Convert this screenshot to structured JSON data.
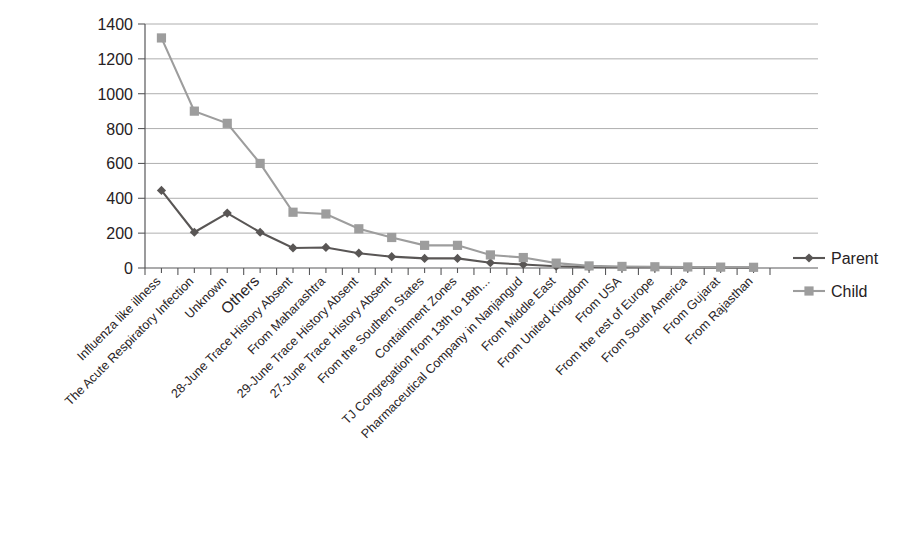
{
  "chart_data": {
    "type": "line",
    "title": "",
    "xlabel": "",
    "ylabel": "",
    "ylim": [
      0,
      1400
    ],
    "ytick_step": 200,
    "yticks": [
      "0",
      "200",
      "400",
      "600",
      "800",
      "1000",
      "1200",
      "1400"
    ],
    "grid": true,
    "legend_position": "right",
    "categories": [
      "Influenza like illness",
      "The Acute Respiratory Infection",
      "Unknown",
      "Others",
      "28-June Trace History Absent",
      "From Maharashtra",
      "29-June Trace History Absent",
      "27-June Trace History Absent",
      "From the Southern States",
      "Containment Zones",
      "TJ Congregation from 13th to 18th...",
      "Pharmaceutical Company in Nanjangud",
      "From Middle East",
      "From United Kingdom",
      "From USA",
      "From the rest of Europe",
      "From South America",
      "From Gujarat",
      "From Rajasthan"
    ],
    "series": [
      {
        "name": "Parent",
        "color": "#595655",
        "marker": "diamond",
        "values": [
          445,
          205,
          315,
          205,
          115,
          118,
          85,
          65,
          55,
          55,
          30,
          20,
          10,
          6,
          5,
          4,
          3,
          3,
          2
        ]
      },
      {
        "name": "Child",
        "color": "#9d9d9d",
        "marker": "square",
        "values": [
          1320,
          900,
          830,
          600,
          320,
          310,
          225,
          175,
          130,
          130,
          75,
          60,
          28,
          12,
          9,
          7,
          6,
          5,
          4
        ]
      }
    ]
  },
  "legend": {
    "items": [
      {
        "label": "Parent",
        "color": "#595655",
        "marker": "diamond"
      },
      {
        "label": "Child",
        "color": "#9d9d9d",
        "marker": "square"
      }
    ]
  },
  "caption": ""
}
